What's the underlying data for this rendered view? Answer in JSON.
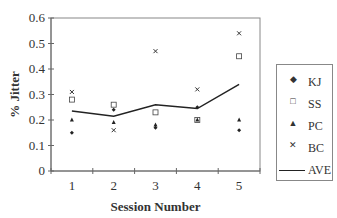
{
  "chart_data": {
    "type": "scatter",
    "title": "",
    "xlabel": "Session Number",
    "ylabel": "% Jitter",
    "categories": [
      "1",
      "2",
      "3",
      "4",
      "5"
    ],
    "ylim": [
      0,
      0.6
    ],
    "yticks": [
      "0",
      "0.1",
      "0.2",
      "0.3",
      "0.4",
      "0.5",
      "0.6"
    ],
    "grid": false,
    "legend_position": "right",
    "series": [
      {
        "name": "KJ",
        "marker": "diamond",
        "values": [
          0.15,
          0.24,
          0.17,
          0.25,
          0.16
        ]
      },
      {
        "name": "SS",
        "marker": "square",
        "values": [
          0.28,
          0.26,
          0.23,
          0.2,
          0.45
        ]
      },
      {
        "name": "PC",
        "marker": "triangle",
        "values": [
          0.2,
          0.19,
          0.18,
          0.2,
          0.2
        ]
      },
      {
        "name": "BC",
        "marker": "x",
        "values": [
          0.31,
          0.16,
          0.47,
          0.32,
          0.54
        ]
      },
      {
        "name": "AVE",
        "marker": "line",
        "values": [
          0.235,
          0.215,
          0.26,
          0.245,
          0.34
        ]
      }
    ]
  },
  "axis": {
    "x_title": "Session Number",
    "y_title": "% Jitter"
  },
  "legend": {
    "items": [
      {
        "label": "KJ",
        "symbol": "◆"
      },
      {
        "label": "SS",
        "symbol": "□"
      },
      {
        "label": "PC",
        "symbol": "▲"
      },
      {
        "label": "BC",
        "symbol": "✕"
      },
      {
        "label": "AVE",
        "symbol": "line"
      }
    ]
  }
}
